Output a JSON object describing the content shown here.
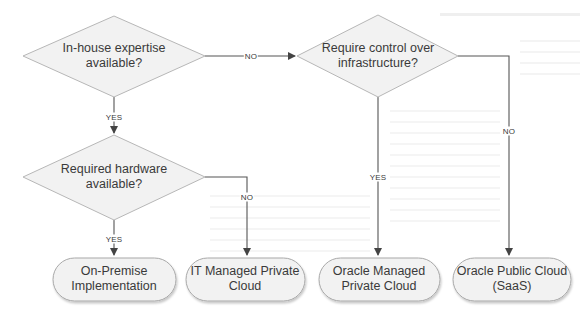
{
  "diagram": {
    "type": "flowchart",
    "colors": {
      "shape_fill": "#f2f2f2",
      "shape_stroke": "#b7b7b7",
      "connector": "#555555",
      "text": "#3a3a3a",
      "background": "#ffffff"
    },
    "decisions": [
      {
        "id": "d1",
        "label_line1": "In-house expertise",
        "label_line2": "available?"
      },
      {
        "id": "d2",
        "label_line1": "Require control over",
        "label_line2": "infrastructure?"
      },
      {
        "id": "d3",
        "label_line1": "Required hardware",
        "label_line2": "available?"
      }
    ],
    "outcomes": [
      {
        "id": "t1",
        "label_line1": "On-Premise",
        "label_line2": "Implementation"
      },
      {
        "id": "t2",
        "label_line1": "IT Managed Private",
        "label_line2": "Cloud"
      },
      {
        "id": "t3",
        "label_line1": "Oracle Managed",
        "label_line2": "Private Cloud"
      },
      {
        "id": "t4",
        "label_line1": "Oracle Public Cloud",
        "label_line2": "(SaaS)"
      }
    ],
    "edges": [
      {
        "from": "d1",
        "to": "d2",
        "label": "NO"
      },
      {
        "from": "d1",
        "to": "d3",
        "label": "YES"
      },
      {
        "from": "d2",
        "to": "t3",
        "label": "YES"
      },
      {
        "from": "d2",
        "to": "t4",
        "label": "NO"
      },
      {
        "from": "d3",
        "to": "t1",
        "label": "YES"
      },
      {
        "from": "d3",
        "to": "t2",
        "label": "NO"
      }
    ]
  }
}
